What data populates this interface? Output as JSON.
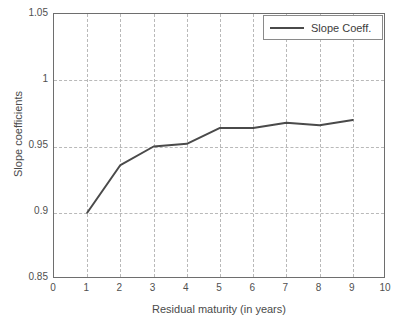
{
  "chart_data": {
    "type": "line",
    "title": "",
    "xlabel": "Residual maturity (in years)",
    "ylabel": "Slope coefficients",
    "xlim": [
      0,
      10
    ],
    "ylim": [
      0.85,
      1.05
    ],
    "xticks": [
      "0",
      "1",
      "2",
      "3",
      "4",
      "5",
      "6",
      "7",
      "8",
      "9",
      "10"
    ],
    "yticks": [
      "0.85",
      "0.9",
      "0.95",
      "1",
      "1.05"
    ],
    "grid": true,
    "legend_position": "top-right",
    "series": [
      {
        "name": "Slope Coeff.",
        "color": "#4a4a4a",
        "x": [
          1,
          2,
          3,
          4,
          5,
          6,
          7,
          8,
          9
        ],
        "values": [
          0.9,
          0.936,
          0.95,
          0.952,
          0.964,
          0.964,
          0.968,
          0.966,
          0.97
        ]
      }
    ]
  },
  "legend": {
    "entries": [
      {
        "label": "Slope Coeff."
      }
    ]
  },
  "axes": {
    "x_title": "Residual maturity (in years)",
    "y_title": "Slope coefficients"
  }
}
